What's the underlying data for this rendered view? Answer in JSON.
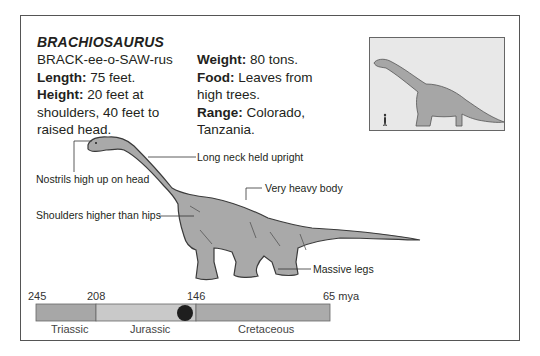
{
  "title": "BRACHIOSAURUS",
  "pronunciation": "BRACK-ee-o-SAW-rus",
  "facts": {
    "length": {
      "label": "Length:",
      "value": " 75 feet."
    },
    "height": {
      "label": "Height:",
      "value": " 20 feet at shoulders, 40 feet to raised head."
    },
    "weight": {
      "label": "Weight:",
      "value": " 80 tons."
    },
    "food": {
      "label": "Food:",
      "value": " Leaves from high trees."
    },
    "range": {
      "label": "Range:",
      "value": " Colorado, Tanzania."
    }
  },
  "callouts": {
    "nostrils": "Nostrils high up on head",
    "neck": "Long neck held upright",
    "body": "Very heavy body",
    "shoulders": "Shoulders higher than hips",
    "legs": "Massive legs"
  },
  "inset": {
    "description": "size comparison: human vs Brachiosaurus silhouette"
  },
  "timeline": {
    "ticks": [
      "245",
      "208",
      "146",
      "65 mya"
    ],
    "periods": [
      {
        "name": "Triassic",
        "color": "#a7a7a7"
      },
      {
        "name": "Jurassic",
        "color": "#c9c9c9"
      },
      {
        "name": "Cretaceous",
        "color": "#ababab"
      }
    ],
    "marker_color": "#1e1e1e"
  },
  "colors": {
    "dino_fill": "#a9a9a9",
    "dino_outline": "#3a3a3a",
    "inset_bg": "#e8e8e8",
    "inset_dino": "#a6a6a6"
  }
}
